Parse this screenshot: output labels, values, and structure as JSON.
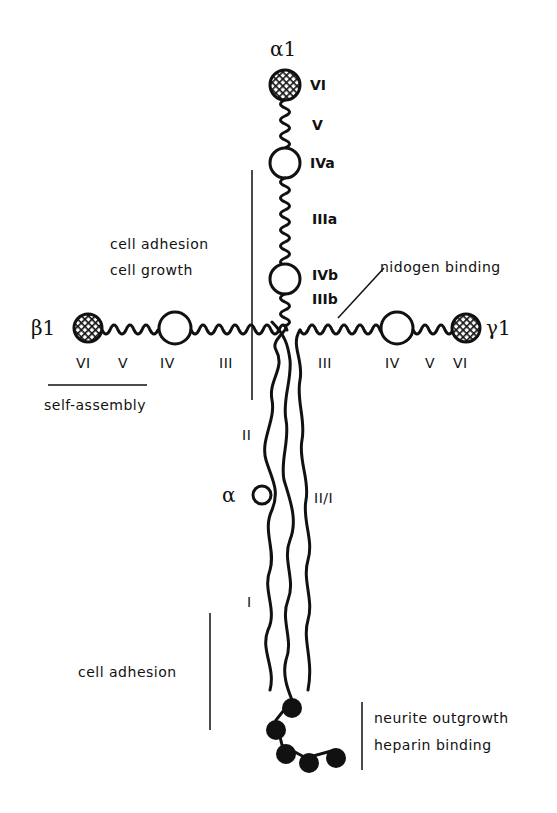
{
  "diagram": {
    "type": "laminin-1 cross-shaped domain structure",
    "chains": {
      "alpha1": {
        "label": "α1",
        "domains": [
          "VI",
          "V",
          "IVa",
          "IIIa",
          "IVb",
          "IIIb"
        ]
      },
      "beta1": {
        "label": "β1",
        "domains": [
          "VI",
          "V",
          "IV",
          "III"
        ]
      },
      "gamma1": {
        "label": "γ1",
        "domains": [
          "III",
          "IV",
          "V",
          "VI"
        ]
      },
      "long_arm": {
        "domains": [
          "II",
          "II/I",
          "I"
        ],
        "alpha_knob_label": "α"
      }
    },
    "labels": {
      "alpha1_title": "α1",
      "a_VI": "VI",
      "a_V": "V",
      "a_IVa": "IVa",
      "a_IIIa": "IIIa",
      "a_IVb": "IVb",
      "a_IIIb": "IIIb",
      "beta1_title": "β1",
      "b_VI": "VI",
      "b_V": "V",
      "b_IV": "IV",
      "b_III": "III",
      "gamma1_title": "γ1",
      "g_III": "III",
      "g_IV": "IV",
      "g_V": "V",
      "g_VI": "VI",
      "arm_II": "II",
      "arm_II_I": "II/I",
      "arm_I": "I",
      "alpha_knob": "α"
    },
    "annotations": {
      "cell_adhesion_growth_1": "cell adhesion",
      "cell_adhesion_growth_2": "cell growth",
      "nidogen": "nidogen binding",
      "self_assembly": "self-assembly",
      "cell_adhesion_lower": "cell adhesion",
      "neurite": "neurite outgrowth",
      "heparin": "heparin binding"
    }
  }
}
